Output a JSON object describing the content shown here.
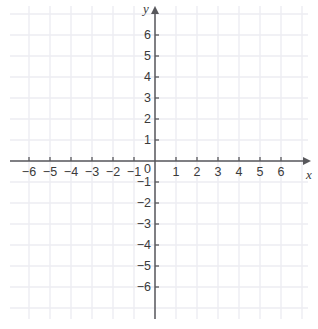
{
  "chart_data": {
    "type": "scatter",
    "title": "",
    "xlabel": "x",
    "ylabel": "y",
    "grid": true,
    "legend": "none",
    "xlim": [
      -7,
      7
    ],
    "ylim": [
      -7,
      7
    ],
    "x_ticks": [
      -6,
      -5,
      -4,
      -3,
      -2,
      -1,
      1,
      2,
      3,
      4,
      5,
      6
    ],
    "y_ticks": [
      6,
      5,
      4,
      3,
      2,
      1,
      -1,
      -2,
      -3,
      -4,
      -5,
      -6
    ],
    "origin_label": "0",
    "x_tick_labels": [
      "−6",
      "−5",
      "−4",
      "−3",
      "−2",
      "−1",
      "1",
      "2",
      "3",
      "4",
      "5",
      "6"
    ],
    "y_tick_labels": [
      "6",
      "5",
      "4",
      "3",
      "2",
      "1",
      "−1",
      "−2",
      "−3",
      "−4",
      "−5",
      "−6"
    ],
    "series": [],
    "values": [],
    "categories": []
  },
  "axes": {
    "x_axis_name": "x",
    "y_axis_name": "y",
    "origin": "0"
  },
  "colors": {
    "background": "#ffffff",
    "gridline": "#ededf2",
    "axis": "#58585c",
    "tick": "#58585c",
    "label_text": "#3a3a3a"
  },
  "geometry": {
    "origin_x_px": 155,
    "origin_y_px": 161,
    "unit_px": 21,
    "grid_left_px": 10,
    "grid_right_px": 308,
    "grid_top_px": 6,
    "grid_bottom_px": 319
  }
}
